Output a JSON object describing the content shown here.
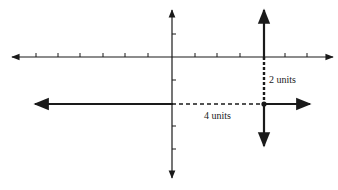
{
  "diagram": {
    "type": "coordinate-plane-translation",
    "colors": {
      "ink": "#1a1a1a",
      "background": "#ffffff"
    },
    "axes": {
      "x_axis": {
        "y": 57,
        "x_start": 12,
        "x_end": 333,
        "ticks_x": [
          36,
          58,
          80,
          103,
          125,
          148,
          195,
          217,
          240,
          285,
          307
        ]
      },
      "y_axis": {
        "x": 172,
        "y_start": 10,
        "y_end": 178,
        "ticks_y": [
          34,
          80,
          126,
          149
        ]
      }
    },
    "translated_axes": {
      "vertical": {
        "x": 264,
        "y_start": 10,
        "y_end": 146
      },
      "horizontal": {
        "y": 104,
        "x_start": 35,
        "x_end": 310
      },
      "origin_dot": {
        "x": 264,
        "y": 104
      }
    },
    "dashed": {
      "horizontal": {
        "x1": 172,
        "x2": 264,
        "y": 104
      },
      "vertical": {
        "x": 264,
        "y1": 57,
        "y2": 104
      }
    },
    "labels": {
      "vertical_shift": "2 units",
      "horizontal_shift": "4 units"
    }
  }
}
